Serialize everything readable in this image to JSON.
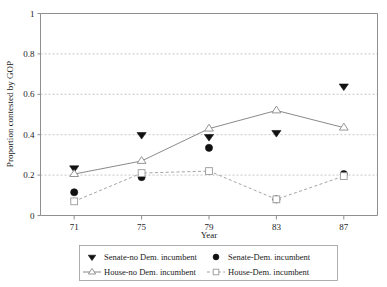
{
  "chart_data": {
    "type": "line",
    "title": "",
    "xlabel": "Year",
    "ylabel": "Proportion contested by GOP",
    "categories": [
      "71",
      "75",
      "79",
      "83",
      "87"
    ],
    "x": [
      71,
      75,
      79,
      83,
      87
    ],
    "xlim": [
      69,
      89
    ],
    "ylim": [
      0,
      1
    ],
    "ytick_labels": [
      "0",
      "0.2",
      "0.4",
      "0.6",
      "0.8",
      "1"
    ],
    "ytick_values": [
      0,
      0.2,
      0.4,
      0.6,
      0.8,
      1
    ],
    "xtick_labels": [
      "71",
      "75",
      "79",
      "83",
      "87"
    ],
    "grid": "horizontal-dashed",
    "legend_position": "bottom",
    "series": [
      {
        "name": "Senate-no Dem. incumbent",
        "marker": "triangle-down-filled",
        "line": "none",
        "color": "#111111",
        "values": [
          0.235,
          0.4,
          0.39,
          0.41,
          0.64
        ]
      },
      {
        "name": "Senate-Dem. incumbent",
        "marker": "circle-filled",
        "line": "none",
        "color": "#111111",
        "values": [
          0.115,
          0.19,
          0.335,
          0.08,
          0.205
        ]
      },
      {
        "name": "House-no Dem. incumbent",
        "marker": "triangle-up-open",
        "line": "solid",
        "color": "#8a8a8a",
        "values": [
          0.205,
          0.27,
          0.43,
          0.52,
          0.435
        ]
      },
      {
        "name": "House-Dem. incumbent",
        "marker": "square-open",
        "line": "dashed",
        "color": "#9a9a9a",
        "values": [
          0.07,
          0.21,
          0.22,
          0.08,
          0.195
        ]
      }
    ]
  },
  "legend": {
    "entries": [
      {
        "label": "Senate-no Dem. incumbent"
      },
      {
        "label": "Senate-Dem. incumbent"
      },
      {
        "label": "House-no Dem. incumbent"
      },
      {
        "label": "House-Dem. incumbent"
      }
    ]
  }
}
